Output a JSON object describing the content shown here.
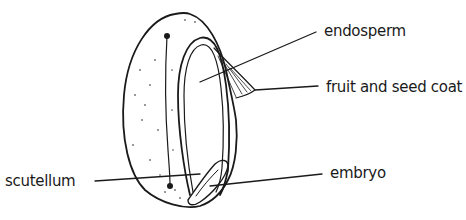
{
  "diagram": {
    "labels": {
      "endosperm": "endosperm",
      "fruit_and_seed_coat": "fruit and seed coat",
      "scutellum": "scutellum",
      "embryo": "embryo"
    }
  }
}
